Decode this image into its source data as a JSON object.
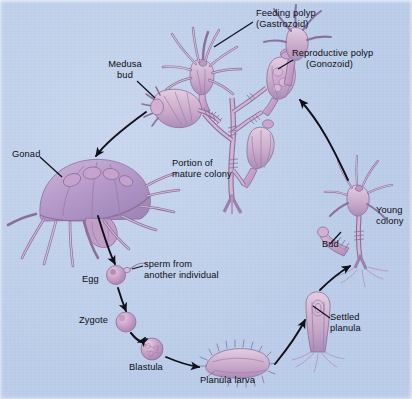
{
  "figure": {
    "background_color": "#b9cbe8",
    "organism_fill": "#c8a8c8",
    "organism_stroke": "#8a6f9b",
    "arrow_color": "#101018",
    "text_color": "#0d0d12"
  },
  "labels": [
    {
      "id": "feeding-polyp",
      "line1": "Feeding polyp",
      "line2": "(Gastrozoid)",
      "x": 256,
      "y": 8,
      "align": "left"
    },
    {
      "id": "reproductive-polyp",
      "line1": "Reproductive polyp",
      "line2": "(Gonozoid)",
      "x": 296,
      "y": 48,
      "align": "left"
    },
    {
      "id": "medusa-bud",
      "line1": "Medusa",
      "line2": "bud",
      "x": 104,
      "y": 59,
      "align": "left"
    },
    {
      "id": "gonad",
      "line1": "Gonad",
      "line2": "",
      "x": 12,
      "y": 149,
      "align": "left"
    },
    {
      "id": "mature-colony",
      "line1": "Portion of",
      "line2": "mature colony",
      "x": 172,
      "y": 158,
      "align": "left"
    },
    {
      "id": "young-colony",
      "line1": "Young",
      "line2": "colony",
      "x": 376,
      "y": 205,
      "align": "left"
    },
    {
      "id": "bud",
      "line1": "Bud",
      "line2": "",
      "x": 322,
      "y": 239,
      "align": "left"
    },
    {
      "id": "sperm",
      "line1": "sperm from",
      "line2": "another individual",
      "x": 144,
      "y": 259,
      "align": "left"
    },
    {
      "id": "egg",
      "line1": "Egg",
      "line2": "",
      "x": 82,
      "y": 274,
      "align": "left"
    },
    {
      "id": "settled-planula",
      "line1": "Settled",
      "line2": "planula",
      "x": 330,
      "y": 312,
      "align": "left"
    },
    {
      "id": "zygote",
      "line1": "Zygote",
      "line2": "",
      "x": 79,
      "y": 315,
      "align": "left"
    },
    {
      "id": "blastula",
      "line1": "Blastula",
      "line2": "",
      "x": 129,
      "y": 362,
      "align": "left"
    },
    {
      "id": "planula-larva",
      "line1": "Planula larva",
      "line2": "",
      "x": 200,
      "y": 375,
      "align": "left"
    }
  ],
  "cycle_stages": [
    "Portion of mature colony",
    "Medusa bud",
    "Medusa with gonad",
    "Egg",
    "Zygote",
    "Blastula",
    "Planula larva",
    "Settled planula",
    "Young colony"
  ]
}
